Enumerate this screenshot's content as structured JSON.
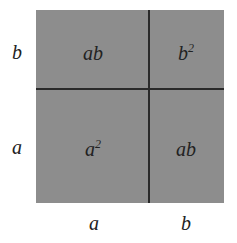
{
  "diagram": {
    "fill_color": "#8d8d8d",
    "line_color": "#2a2a2a",
    "side_labels": {
      "left_top": "b",
      "left_bottom": "a",
      "bottom_left": "a",
      "bottom_right": "b"
    },
    "cells": {
      "top_left": "ab",
      "top_right_base": "b",
      "top_right_exp": "2",
      "bottom_left_base": "a",
      "bottom_left_exp": "2",
      "bottom_right": "ab"
    }
  }
}
